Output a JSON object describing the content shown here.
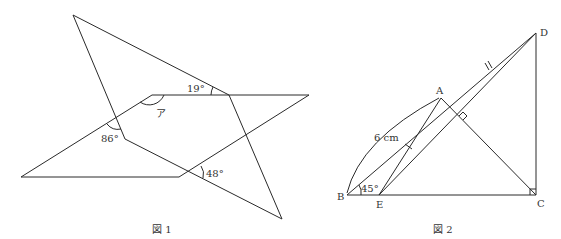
{
  "figure1": {
    "caption": "図 1",
    "angles": {
      "top": "19°",
      "left": "86°",
      "bottom": "48°",
      "unknown": "ア"
    }
  },
  "figure2": {
    "caption": "図 2",
    "points": {
      "A": "A",
      "B": "B",
      "C": "C",
      "D": "D",
      "E": "E"
    },
    "length_label": "6 cm",
    "angle_B": "45°"
  }
}
